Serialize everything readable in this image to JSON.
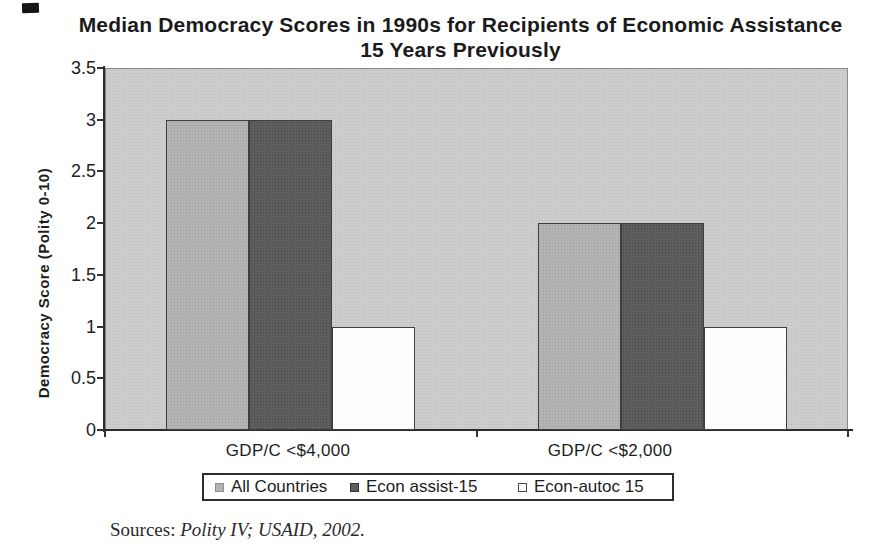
{
  "chart_data": {
    "type": "bar",
    "title": "Median Democracy Scores in 1990s for Recipients of Economic Assistance",
    "title_line2": "15 Years Previously",
    "ylabel": "Democracy Score (Polity 0-10)",
    "categories": [
      "GDP/C <$4,000",
      "GDP/C <$2,000"
    ],
    "series": [
      {
        "name": "All Countries",
        "values": [
          3,
          2
        ],
        "color": "#b3b3b3"
      },
      {
        "name": "Econ assist-15",
        "values": [
          3,
          2
        ],
        "color": "#5e5e5e"
      },
      {
        "name": "Econ-autoc 15",
        "values": [
          1,
          1
        ],
        "color": "#fdfdfd"
      }
    ],
    "ylim": [
      0,
      3.5
    ],
    "yticks": [
      0,
      0.5,
      1,
      1.5,
      2,
      2.5,
      3,
      3.5
    ],
    "ytick_labels": [
      "0",
      "0.5",
      "1",
      "1.5",
      "2",
      "2.5",
      "3",
      "3.5"
    ],
    "grid": false,
    "legend_position": "bottom",
    "plot_bg": "#cdcdcd"
  },
  "source": {
    "prefix": "Sources: ",
    "citation": "Polity IV; USAID, 2002."
  }
}
